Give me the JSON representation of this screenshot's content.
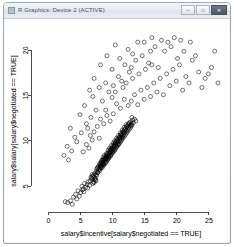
{
  "window": {
    "title": "R Graphics: Device 2 (ACTIVE)",
    "icon": "app-icon",
    "buttons": [
      {
        "name": "minimize",
        "glyph": "─"
      },
      {
        "name": "maximize",
        "glyph": "□"
      },
      {
        "name": "close",
        "glyph": "✕"
      }
    ]
  },
  "chart_data": {
    "type": "scatter",
    "title": "",
    "xlabel": "salary$incentive[salary$negotiated == TRUE]",
    "ylabel": "salary$salary[salary$negotiated == TRUE]",
    "xlim": [
      -1.8,
      27.5
    ],
    "ylim": [
      2.6,
      21.8
    ],
    "xticks": [
      0,
      5,
      10,
      15,
      20,
      25
    ],
    "yticks": [
      5,
      10,
      15,
      20
    ],
    "grid": false,
    "legend": null,
    "marker": {
      "shape": "open-circle",
      "color": "#000000",
      "size": 2.0
    },
    "points": [
      [
        7.2,
        6.4
      ],
      [
        7.4,
        6.6
      ],
      [
        7.6,
        6.5
      ],
      [
        7.8,
        6.8
      ],
      [
        7.5,
        6.9
      ],
      [
        7.9,
        7.0
      ],
      [
        8.0,
        6.7
      ],
      [
        7.7,
        7.1
      ],
      [
        8.1,
        7.2
      ],
      [
        8.2,
        7.0
      ],
      [
        8.3,
        7.3
      ],
      [
        8.0,
        7.4
      ],
      [
        8.4,
        7.1
      ],
      [
        8.5,
        7.5
      ],
      [
        8.2,
        7.6
      ],
      [
        8.6,
        7.3
      ],
      [
        8.7,
        7.7
      ],
      [
        8.4,
        7.8
      ],
      [
        8.8,
        7.5
      ],
      [
        8.9,
        7.9
      ],
      [
        8.6,
        8.0
      ],
      [
        9.0,
        7.7
      ],
      [
        9.1,
        8.1
      ],
      [
        8.8,
        8.2
      ],
      [
        9.2,
        7.9
      ],
      [
        9.3,
        8.3
      ],
      [
        9.0,
        8.4
      ],
      [
        9.4,
        8.1
      ],
      [
        9.5,
        8.5
      ],
      [
        9.2,
        8.6
      ],
      [
        9.6,
        8.3
      ],
      [
        9.7,
        8.7
      ],
      [
        9.4,
        8.8
      ],
      [
        9.8,
        8.5
      ],
      [
        9.9,
        8.9
      ],
      [
        9.6,
        9.0
      ],
      [
        10.0,
        8.7
      ],
      [
        10.1,
        9.1
      ],
      [
        9.8,
        9.2
      ],
      [
        10.2,
        8.9
      ],
      [
        10.3,
        9.3
      ],
      [
        10.0,
        9.4
      ],
      [
        10.4,
        9.1
      ],
      [
        10.5,
        9.5
      ],
      [
        10.2,
        9.6
      ],
      [
        10.6,
        9.3
      ],
      [
        10.7,
        9.7
      ],
      [
        10.4,
        9.8
      ],
      [
        10.8,
        9.5
      ],
      [
        10.9,
        9.9
      ],
      [
        10.6,
        10.0
      ],
      [
        11.0,
        9.7
      ],
      [
        11.1,
        10.1
      ],
      [
        10.8,
        10.2
      ],
      [
        11.2,
        9.9
      ],
      [
        11.3,
        10.3
      ],
      [
        11.0,
        10.4
      ],
      [
        11.4,
        10.1
      ],
      [
        11.5,
        10.5
      ],
      [
        11.2,
        10.6
      ],
      [
        11.6,
        10.3
      ],
      [
        11.7,
        10.7
      ],
      [
        11.4,
        10.8
      ],
      [
        11.8,
        10.5
      ],
      [
        11.9,
        10.9
      ],
      [
        11.6,
        11.0
      ],
      [
        12.0,
        10.7
      ],
      [
        12.1,
        11.1
      ],
      [
        11.8,
        11.2
      ],
      [
        12.2,
        10.9
      ],
      [
        12.3,
        11.3
      ],
      [
        12.0,
        11.4
      ],
      [
        12.4,
        11.1
      ],
      [
        12.5,
        11.5
      ],
      [
        12.2,
        11.6
      ],
      [
        12.6,
        11.3
      ],
      [
        12.7,
        11.7
      ],
      [
        12.4,
        11.8
      ],
      [
        12.8,
        11.5
      ],
      [
        12.9,
        11.9
      ],
      [
        12.6,
        12.0
      ],
      [
        13.0,
        11.7
      ],
      [
        6.9,
        6.1
      ],
      [
        7.0,
        6.2
      ],
      [
        7.1,
        6.0
      ],
      [
        6.8,
        6.3
      ],
      [
        7.3,
        5.9
      ],
      [
        7.5,
        6.2
      ],
      [
        7.2,
        5.8
      ],
      [
        6.7,
        5.9
      ],
      [
        8.3,
        7.9
      ],
      [
        8.5,
        8.2
      ],
      [
        8.7,
        8.4
      ],
      [
        9.0,
        8.6
      ],
      [
        9.3,
        9.0
      ],
      [
        9.5,
        9.2
      ],
      [
        9.8,
        9.5
      ],
      [
        10.1,
        9.8
      ],
      [
        10.3,
        10.0
      ],
      [
        10.6,
        10.3
      ],
      [
        10.9,
        10.6
      ],
      [
        11.2,
        10.9
      ],
      [
        11.5,
        11.2
      ],
      [
        11.8,
        11.5
      ],
      [
        12.1,
        11.8
      ],
      [
        8.0,
        7.5
      ],
      [
        8.2,
        7.7
      ],
      [
        8.4,
        7.4
      ],
      [
        8.6,
        7.8
      ],
      [
        8.9,
        8.1
      ],
      [
        9.1,
        8.3
      ],
      [
        9.4,
        8.5
      ],
      [
        9.6,
        8.8
      ],
      [
        9.9,
        9.1
      ],
      [
        10.2,
        9.4
      ],
      [
        10.5,
        9.7
      ],
      [
        10.8,
        10.0
      ],
      [
        11.1,
        10.3
      ],
      [
        11.4,
        10.6
      ],
      [
        11.7,
        10.9
      ],
      [
        7.6,
        7.0
      ],
      [
        7.8,
        7.2
      ],
      [
        8.1,
        7.3
      ],
      [
        8.3,
        7.6
      ],
      [
        8.5,
        7.9
      ],
      [
        8.8,
        8.0
      ],
      [
        9.0,
        8.2
      ],
      [
        9.2,
        8.5
      ],
      [
        9.5,
        8.7
      ],
      [
        9.7,
        9.0
      ],
      [
        10.0,
        9.2
      ],
      [
        10.2,
        9.5
      ],
      [
        10.4,
        9.8
      ],
      [
        10.7,
        10.1
      ],
      [
        11.0,
        10.4
      ],
      [
        11.3,
        10.7
      ],
      [
        11.6,
        11.0
      ],
      [
        11.9,
        11.3
      ],
      [
        12.2,
        11.6
      ],
      [
        12.5,
        11.9
      ],
      [
        7.4,
        6.3
      ],
      [
        7.7,
        6.5
      ],
      [
        8.0,
        6.9
      ],
      [
        8.2,
        7.1
      ],
      [
        8.6,
        7.4
      ],
      [
        8.9,
        7.6
      ],
      [
        9.2,
        8.0
      ],
      [
        9.4,
        8.2
      ],
      [
        9.7,
        8.4
      ],
      [
        10.0,
        8.8
      ],
      [
        10.3,
        9.0
      ],
      [
        10.6,
        9.4
      ],
      [
        10.9,
        9.6
      ],
      [
        11.2,
        10.0
      ],
      [
        11.5,
        10.4
      ],
      [
        6.5,
        5.6
      ],
      [
        6.8,
        5.8
      ],
      [
        7.0,
        5.5
      ],
      [
        7.3,
        5.7
      ],
      [
        6.6,
        6.0
      ],
      [
        7.1,
        5.4
      ],
      [
        6.9,
        5.3
      ],
      [
        7.4,
        5.6
      ],
      [
        12.8,
        12.1
      ],
      [
        13.1,
        12.3
      ],
      [
        12.9,
        11.8
      ],
      [
        13.2,
        12.0
      ],
      [
        13.4,
        12.4
      ],
      [
        13.0,
        12.6
      ],
      [
        13.6,
        12.2
      ],
      [
        5.2,
        5.0
      ],
      [
        5.6,
        5.3
      ],
      [
        6.0,
        5.2
      ],
      [
        6.2,
        5.5
      ],
      [
        5.8,
        4.9
      ],
      [
        6.4,
        5.1
      ],
      [
        5.4,
        4.7
      ],
      [
        6.1,
        4.8
      ],
      [
        4.6,
        4.5
      ],
      [
        5.0,
        4.3
      ],
      [
        4.2,
        4.1
      ],
      [
        5.3,
        4.6
      ],
      [
        4.8,
        3.9
      ],
      [
        5.5,
        4.4
      ],
      [
        3.9,
        3.8
      ],
      [
        4.4,
        3.6
      ],
      [
        3.4,
        3.4
      ],
      [
        3.0,
        3.2
      ],
      [
        3.7,
        3.0
      ],
      [
        2.6,
        3.3
      ],
      [
        6.3,
        9.2
      ],
      [
        6.8,
        10.1
      ],
      [
        7.1,
        11.0
      ],
      [
        5.9,
        9.6
      ],
      [
        7.6,
        11.6
      ],
      [
        8.1,
        12.4
      ],
      [
        6.5,
        10.6
      ],
      [
        5.4,
        8.8
      ],
      [
        7.9,
        10.3
      ],
      [
        8.6,
        11.9
      ],
      [
        9.1,
        12.8
      ],
      [
        6.1,
        11.4
      ],
      [
        8.9,
        13.4
      ],
      [
        9.6,
        12.2
      ],
      [
        10.1,
        13.0
      ],
      [
        10.6,
        14.1
      ],
      [
        11.2,
        13.6
      ],
      [
        11.8,
        14.6
      ],
      [
        12.4,
        13.9
      ],
      [
        9.9,
        14.8
      ],
      [
        10.4,
        15.4
      ],
      [
        11.6,
        15.9
      ],
      [
        12.9,
        14.4
      ],
      [
        13.4,
        15.1
      ],
      [
        13.9,
        14.0
      ],
      [
        12.1,
        16.4
      ],
      [
        13.1,
        16.9
      ],
      [
        14.4,
        15.6
      ],
      [
        14.9,
        14.6
      ],
      [
        15.4,
        15.9
      ],
      [
        15.9,
        14.9
      ],
      [
        16.4,
        16.4
      ],
      [
        14.1,
        17.4
      ],
      [
        15.1,
        17.9
      ],
      [
        16.9,
        15.4
      ],
      [
        17.4,
        16.9
      ],
      [
        17.9,
        15.1
      ],
      [
        16.1,
        18.4
      ],
      [
        13.6,
        18.9
      ],
      [
        12.6,
        17.6
      ],
      [
        11.4,
        16.6
      ],
      [
        10.9,
        17.1
      ],
      [
        14.6,
        19.4
      ],
      [
        15.6,
        18.6
      ],
      [
        17.1,
        18.1
      ],
      [
        18.4,
        17.4
      ],
      [
        18.9,
        16.1
      ],
      [
        19.4,
        17.9
      ],
      [
        19.9,
        16.6
      ],
      [
        20.4,
        18.4
      ],
      [
        21.4,
        17.1
      ],
      [
        22.4,
        18.9
      ],
      [
        20.9,
        15.6
      ],
      [
        21.9,
        16.4
      ],
      [
        23.4,
        17.6
      ],
      [
        24.4,
        16.9
      ],
      [
        25.4,
        18.1
      ],
      [
        23.9,
        15.9
      ],
      [
        22.9,
        19.4
      ],
      [
        24.9,
        17.4
      ],
      [
        26.4,
        16.4
      ],
      [
        25.9,
        19.9
      ],
      [
        18.1,
        19.9
      ],
      [
        16.6,
        20.4
      ],
      [
        14.9,
        20.9
      ],
      [
        19.1,
        20.4
      ],
      [
        20.1,
        19.1
      ],
      [
        17.6,
        21.1
      ],
      [
        13.1,
        19.6
      ],
      [
        11.9,
        18.4
      ],
      [
        10.1,
        16.1
      ],
      [
        9.4,
        15.4
      ],
      [
        8.4,
        14.4
      ],
      [
        7.4,
        13.4
      ],
      [
        6.6,
        12.6
      ],
      [
        5.9,
        11.9
      ],
      [
        5.1,
        10.9
      ],
      [
        4.4,
        9.9
      ],
      [
        3.6,
        8.9
      ],
      [
        4.9,
        12.9
      ],
      [
        3.1,
        7.9
      ],
      [
        6.9,
        14.9
      ],
      [
        8.9,
        16.4
      ],
      [
        7.9,
        15.9
      ],
      [
        9.9,
        17.9
      ],
      [
        11.1,
        19.1
      ],
      [
        12.4,
        20.1
      ],
      [
        4.1,
        10.4
      ],
      [
        2.9,
        9.4
      ],
      [
        3.4,
        11.4
      ],
      [
        2.4,
        8.4
      ],
      [
        5.6,
        13.9
      ],
      [
        6.4,
        15.6
      ],
      [
        7.1,
        16.9
      ],
      [
        8.1,
        18.4
      ],
      [
        9.1,
        19.4
      ],
      [
        10.4,
        20.6
      ],
      [
        13.9,
        20.9
      ],
      [
        15.9,
        19.9
      ],
      [
        12.9,
        18.1
      ],
      [
        21.1,
        19.9
      ],
      [
        22.1,
        20.9
      ],
      [
        19.6,
        21.4
      ],
      [
        16.1,
        21.4
      ],
      [
        18.6,
        20.9
      ],
      [
        20.6,
        21.1
      ]
    ]
  }
}
